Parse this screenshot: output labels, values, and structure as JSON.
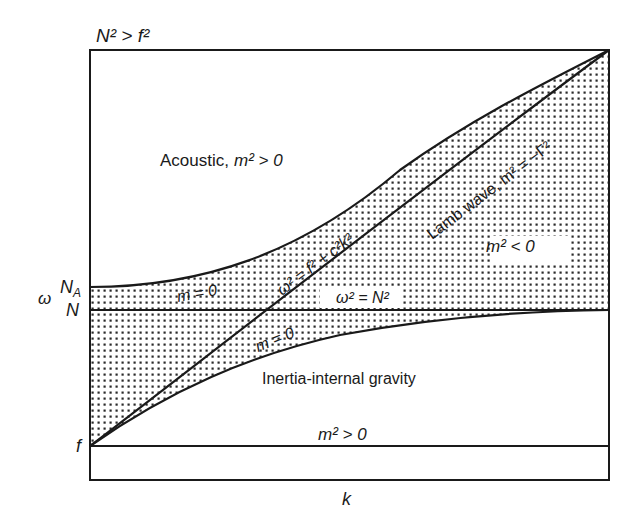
{
  "diagram": {
    "title_condition": "N² > f²",
    "axes": {
      "y_label": "ω",
      "x_label": "k",
      "y_ticks": [
        {
          "label": "N_A",
          "main": "N",
          "sub": "A"
        },
        {
          "label": "N",
          "main": "N",
          "sub": ""
        },
        {
          "label": "f",
          "main": "f",
          "sub": ""
        }
      ]
    },
    "regions": {
      "acoustic": {
        "name": "Acoustic,",
        "condition": "m² > 0"
      },
      "evanescent": {
        "condition": "m² < 0"
      },
      "inertia_gravity": {
        "name": "Inertia-internal gravity"
      },
      "lower": {
        "condition": "m² > 0"
      }
    },
    "curves": {
      "upper_m0": "m = 0",
      "lower_m0": "m = 0",
      "lamb_dispersion": "ω² = f² + c²k²",
      "lamb_wave": "Lamb wave, m² = −Γ²",
      "buoyancy": "ω² = N²"
    },
    "colors": {
      "line": "#1a1a1a",
      "dot": "#2a2a2a",
      "background": "#ffffff"
    }
  }
}
